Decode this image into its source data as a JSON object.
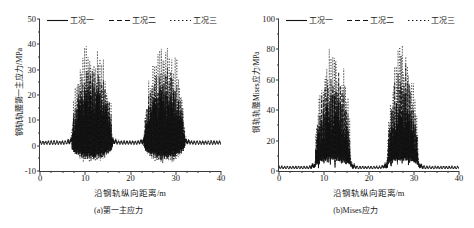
{
  "figure": {
    "panels": [
      {
        "id": "panel-a",
        "caption": "(a)第一主应力",
        "ylabel": "钢轨轨腰第一主应力/MPa",
        "xlabel": "沿钢轨纵向距离/m",
        "yticks": [
          "-10",
          "0",
          "10",
          "20",
          "30",
          "40",
          "50"
        ],
        "xticks": [
          "0",
          "10",
          "20",
          "30",
          "40"
        ]
      },
      {
        "id": "panel-b",
        "caption": "(b)Mises应力",
        "ylabel": "钢轨轨腰Mises应力/MPa",
        "xlabel": "沿钢轨纵向距离/m",
        "yticks": [
          "0",
          "20",
          "40",
          "60",
          "80",
          "100"
        ],
        "xticks": [
          "0",
          "10",
          "20",
          "30",
          "40"
        ]
      }
    ],
    "legend": [
      {
        "label": "工况一",
        "style": "solid"
      },
      {
        "label": "工况二",
        "style": "dashed"
      },
      {
        "label": "工况三",
        "style": "dotted"
      }
    ]
  },
  "chart_data": [
    {
      "type": "line",
      "id": "panel-a",
      "title": "(a)第一主应力",
      "xlabel": "沿钢轨纵向距离/m",
      "ylabel": "钢轨轨腰第一主应力/MPa",
      "xlim": [
        0,
        40
      ],
      "ylim": [
        -10,
        50
      ],
      "xticks": [
        0,
        10,
        20,
        30,
        40
      ],
      "yticks": [
        -10,
        0,
        10,
        20,
        30,
        40,
        50
      ],
      "xminor_step": 2.5,
      "yminor_step": 5,
      "grid": false,
      "legend_position": "top-inside",
      "description": "高频振荡曲线：基线附近为小幅锯齿(0~2 MPa)，在 7~16 m 与 23~32 m 两个区段出现密集的大幅尖峰，峰值可达 40 MPa 以上，谷值约 -7 MPa。",
      "baseline_band": [
        0,
        2
      ],
      "burst_regions": [
        [
          7,
          16
        ],
        [
          23,
          32
        ]
      ],
      "series": [
        {
          "name": "工况一",
          "style": "solid",
          "color": "#111111",
          "baseline_amplitude": 1.6,
          "burst_peak": 24,
          "burst_trough": -5.5,
          "sample_x": [
            0,
            2,
            4,
            6,
            7,
            8,
            9,
            10,
            11,
            12,
            13,
            14,
            15,
            16,
            17,
            19,
            21,
            23,
            24,
            25,
            26,
            27,
            28,
            29,
            30,
            31,
            32,
            33,
            35,
            37,
            40
          ],
          "sample_y": [
            1.0,
            1.2,
            1.1,
            1.3,
            2.5,
            8.0,
            15.0,
            20.0,
            22.0,
            24.0,
            21.0,
            19.0,
            12.0,
            4.0,
            1.5,
            1.2,
            1.1,
            2.0,
            7.0,
            14.0,
            19.0,
            22.0,
            23.0,
            20.0,
            17.0,
            10.0,
            3.0,
            1.4,
            1.1,
            1.2,
            1.0
          ]
        },
        {
          "name": "工况二",
          "style": "dashed",
          "color": "#111111",
          "baseline_amplitude": 1.8,
          "burst_peak": 31,
          "burst_trough": -6.5,
          "sample_x": [
            0,
            2,
            4,
            6,
            7,
            8,
            9,
            10,
            11,
            12,
            13,
            14,
            15,
            16,
            17,
            19,
            21,
            23,
            24,
            25,
            26,
            27,
            28,
            29,
            30,
            31,
            32,
            33,
            35,
            37,
            40
          ],
          "sample_y": [
            1.1,
            1.3,
            1.2,
            1.5,
            3.0,
            10.0,
            19.0,
            25.0,
            28.0,
            30.0,
            27.0,
            24.0,
            15.0,
            5.0,
            1.7,
            1.3,
            1.2,
            2.4,
            9.0,
            18.0,
            24.0,
            28.0,
            29.0,
            26.0,
            21.0,
            13.0,
            4.0,
            1.6,
            1.2,
            1.3,
            1.1
          ]
        },
        {
          "name": "工况三",
          "style": "dotted",
          "color": "#111111",
          "baseline_amplitude": 2.0,
          "burst_peak": 41,
          "burst_trough": -7.5,
          "sample_x": [
            0,
            2,
            4,
            6,
            7,
            8,
            9,
            10,
            11,
            12,
            13,
            14,
            15,
            16,
            17,
            19,
            21,
            23,
            24,
            25,
            26,
            27,
            28,
            29,
            30,
            31,
            32,
            33,
            35,
            37,
            40
          ],
          "sample_y": [
            1.2,
            1.4,
            1.3,
            1.7,
            3.6,
            13.0,
            25.0,
            33.0,
            37.0,
            40.0,
            36.0,
            32.0,
            20.0,
            6.5,
            2.0,
            1.5,
            1.4,
            3.0,
            12.0,
            24.0,
            32.0,
            37.0,
            39.0,
            34.0,
            28.0,
            17.0,
            5.0,
            1.9,
            1.4,
            1.5,
            1.2
          ]
        }
      ]
    },
    {
      "type": "line",
      "id": "panel-b",
      "title": "(b)Mises应力",
      "xlabel": "沿钢轨纵向距离/m",
      "ylabel": "钢轨轨腰Mises应力/MPa",
      "xlim": [
        0,
        40
      ],
      "ylim": [
        0,
        100
      ],
      "xticks": [
        0,
        10,
        20,
        30,
        40
      ],
      "yticks": [
        0,
        20,
        40,
        60,
        80,
        100
      ],
      "xminor_step": 2.5,
      "yminor_step": 10,
      "grid": false,
      "legend_position": "top-inside",
      "description": "Mises 应力恒为正：基线约 1~3 MPa 的小锯齿，在 8~16 m 与 24~31 m 两个区段跃升为密集尖峰，最高约 85 MPa，区段内谷值约 8~15 MPa。",
      "baseline_band": [
        1,
        3
      ],
      "burst_regions": [
        [
          8,
          16
        ],
        [
          24,
          31
        ]
      ],
      "series": [
        {
          "name": "工况一",
          "style": "solid",
          "color": "#111111",
          "baseline_amplitude": 2.0,
          "burst_peak": 48,
          "burst_trough": 8,
          "sample_x": [
            0,
            2,
            4,
            6,
            7,
            8,
            9,
            10,
            11,
            12,
            13,
            14,
            15,
            16,
            17,
            19,
            21,
            23,
            24,
            25,
            26,
            27,
            28,
            29,
            30,
            31,
            32,
            33,
            35,
            37,
            40
          ],
          "sample_y": [
            1.5,
            1.6,
            1.5,
            2.0,
            4.0,
            14.0,
            34.0,
            44.0,
            46.0,
            47.0,
            45.0,
            42.0,
            30.0,
            8.0,
            2.5,
            1.8,
            1.7,
            3.0,
            12.0,
            34.0,
            44.0,
            47.0,
            46.0,
            43.0,
            36.0,
            18.0,
            4.0,
            2.2,
            1.7,
            1.8,
            1.5
          ]
        },
        {
          "name": "工况二",
          "style": "dashed",
          "color": "#111111",
          "baseline_amplitude": 2.2,
          "burst_peak": 64,
          "burst_trough": 10,
          "sample_x": [
            0,
            2,
            4,
            6,
            7,
            8,
            9,
            10,
            11,
            12,
            13,
            14,
            15,
            16,
            17,
            19,
            21,
            23,
            24,
            25,
            26,
            27,
            28,
            29,
            30,
            31,
            32,
            33,
            35,
            37,
            40
          ],
          "sample_y": [
            1.8,
            1.9,
            1.8,
            2.4,
            5.0,
            19.0,
            45.0,
            58.0,
            62.0,
            63.0,
            60.0,
            56.0,
            40.0,
            10.0,
            3.0,
            2.1,
            2.0,
            3.8,
            16.0,
            45.0,
            58.0,
            63.0,
            61.0,
            57.0,
            47.0,
            24.0,
            5.0,
            2.6,
            2.0,
            2.1,
            1.8
          ]
        },
        {
          "name": "工况三",
          "style": "dotted",
          "color": "#111111",
          "baseline_amplitude": 2.5,
          "burst_peak": 85,
          "burst_trough": 13,
          "sample_x": [
            0,
            2,
            4,
            6,
            7,
            8,
            9,
            10,
            11,
            12,
            13,
            14,
            15,
            16,
            17,
            19,
            21,
            23,
            24,
            25,
            26,
            27,
            28,
            29,
            30,
            31,
            32,
            33,
            35,
            37,
            40
          ],
          "sample_y": [
            2.0,
            2.2,
            2.1,
            2.8,
            6.0,
            25.0,
            60.0,
            77.0,
            82.0,
            84.0,
            80.0,
            74.0,
            53.0,
            13.0,
            3.5,
            2.4,
            2.3,
            4.5,
            21.0,
            60.0,
            77.0,
            84.0,
            81.0,
            76.0,
            62.0,
            32.0,
            6.0,
            3.0,
            2.3,
            2.4,
            2.0
          ]
        }
      ]
    }
  ]
}
